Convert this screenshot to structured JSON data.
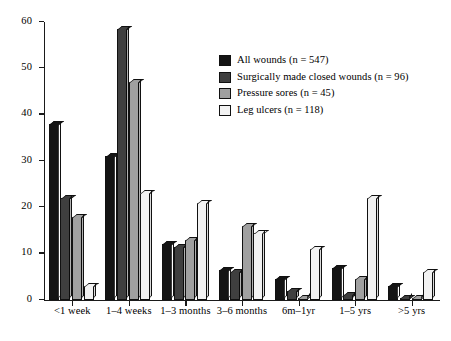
{
  "chart_data": {
    "type": "bar",
    "title": "",
    "subtitle": "",
    "xlabel": "",
    "ylabel": "",
    "ylim": [
      0,
      60
    ],
    "yticks": [
      0,
      10,
      20,
      30,
      40,
      50,
      60
    ],
    "grid": false,
    "legend_position": "upper-right",
    "orientation": "vertical-grouped-3d",
    "categories": [
      "<1 week",
      "1–4 weeks",
      "1–3 months",
      "3–6 months",
      "6m–1yr",
      "1–5 yrs",
      ">5 yrs"
    ],
    "series": [
      {
        "name": "All wounds (n = 547)",
        "color": "#141414",
        "values": [
          38,
          31,
          12,
          6.5,
          4.5,
          7,
          3
        ]
      },
      {
        "name": "Surgically made closed wounds (n = 96)",
        "color": "#3f3f3f",
        "values": [
          22,
          58.5,
          11.5,
          6,
          2,
          1,
          0
        ]
      },
      {
        "name": "Pressure sores (n = 45)",
        "color": "#a0a0a0",
        "values": [
          18,
          47,
          13,
          16,
          0.5,
          4.5,
          0.5
        ]
      },
      {
        "name": "Leg ulcers (n = 118)",
        "color": "#f2f2f2",
        "values": [
          3,
          23,
          21,
          14.5,
          11,
          22,
          6
        ]
      }
    ]
  },
  "legend": {
    "items": [
      {
        "label": "All wounds (n = 547)",
        "color": "#141414"
      },
      {
        "label": "Surgically made closed wounds (n = 96)",
        "color": "#3f3f3f"
      },
      {
        "label": "Pressure sores (n = 45)",
        "color": "#a0a0a0"
      },
      {
        "label": "Leg ulcers (n = 118)",
        "color": "#f2f2f2"
      }
    ]
  }
}
